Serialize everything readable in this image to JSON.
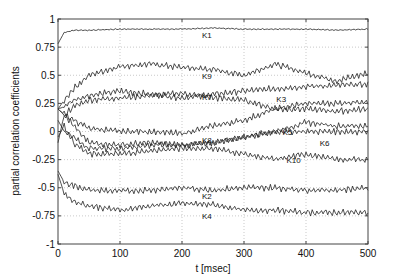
{
  "chart_data": {
    "type": "line",
    "title": "",
    "xlabel": "t [msec]",
    "ylabel": "partial correlation coefficients",
    "xlim": [
      0,
      500
    ],
    "ylim": [
      -1,
      1
    ],
    "grid": true,
    "legend": "inline labels",
    "xticks": [
      "0",
      "100",
      "200",
      "300",
      "400",
      "500"
    ],
    "yticks": [
      "-1",
      "-0.75",
      "-0.5",
      "-0.25",
      "0",
      "0.25",
      "0.5",
      "0.75",
      "1"
    ],
    "x": [
      0,
      10,
      25,
      50,
      100,
      150,
      200,
      250,
      300,
      350,
      400,
      450,
      500
    ],
    "series": [
      {
        "name": "K1",
        "label_at": [
          240,
          0.83
        ],
        "values": [
          0.78,
          0.88,
          0.9,
          0.9,
          0.91,
          0.91,
          0.91,
          0.92,
          0.91,
          0.91,
          0.91,
          0.9,
          0.91
        ]
      },
      {
        "name": "K9",
        "label_at": [
          240,
          0.47
        ],
        "values": [
          0.2,
          0.28,
          0.38,
          0.5,
          0.58,
          0.6,
          0.57,
          0.55,
          0.5,
          0.6,
          0.52,
          0.45,
          0.52
        ]
      },
      {
        "name": "K3",
        "label_at": [
          360,
          0.26
        ],
        "values": [
          0.2,
          0.22,
          0.28,
          0.32,
          0.36,
          0.33,
          0.3,
          0.33,
          0.36,
          0.38,
          0.4,
          0.41,
          0.42
        ]
      },
      {
        "name": "K7",
        "label_at": [
          240,
          0.28
        ],
        "values": [
          0.2,
          0.15,
          0.22,
          0.28,
          0.3,
          0.32,
          0.34,
          0.3,
          0.28,
          0.2,
          0.2,
          0.18,
          0.2
        ]
      },
      {
        "name": "K8",
        "label_at": [
          240,
          -0.1
        ],
        "values": [
          0.2,
          0.15,
          0.1,
          0.03,
          0.0,
          0.0,
          -0.02,
          0.05,
          0.1,
          0.2,
          0.25,
          0.25,
          0.27
        ]
      },
      {
        "name": "K5",
        "label_at": [
          370,
          -0.03
        ],
        "values": [
          -0.1,
          0.15,
          0.05,
          -0.1,
          -0.12,
          -0.1,
          -0.12,
          -0.1,
          -0.05,
          0.0,
          0.08,
          0.05,
          0.05
        ]
      },
      {
        "name": "K6",
        "label_at": [
          430,
          -0.13
        ],
        "values": [
          0.1,
          0.0,
          -0.05,
          -0.15,
          -0.15,
          -0.12,
          -0.12,
          -0.1,
          -0.05,
          0.0,
          0.0,
          0.0,
          0.0
        ]
      },
      {
        "name": "K10",
        "label_at": [
          380,
          -0.28
        ],
        "values": [
          -0.05,
          0.05,
          -0.1,
          -0.2,
          -0.2,
          -0.17,
          -0.15,
          -0.15,
          -0.2,
          -0.25,
          -0.2,
          -0.25,
          -0.25
        ]
      },
      {
        "name": "K2",
        "label_at": [
          240,
          -0.6
        ],
        "values": [
          -0.35,
          -0.45,
          -0.48,
          -0.52,
          -0.53,
          -0.52,
          -0.5,
          -0.52,
          -0.5,
          -0.5,
          -0.52,
          -0.52,
          -0.5
        ]
      },
      {
        "name": "K4",
        "label_at": [
          240,
          -0.78
        ],
        "values": [
          -0.38,
          -0.55,
          -0.62,
          -0.66,
          -0.7,
          -0.66,
          -0.64,
          -0.65,
          -0.7,
          -0.7,
          -0.72,
          -0.72,
          -0.72
        ]
      }
    ]
  },
  "colors": {
    "line": "#222222",
    "axis": "#444444",
    "grid": "#bbbbbb"
  }
}
